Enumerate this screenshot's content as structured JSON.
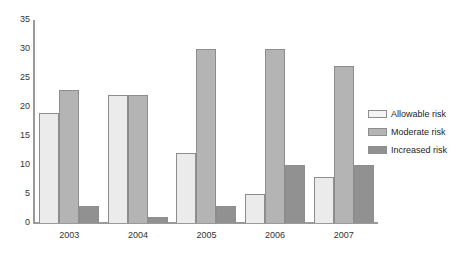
{
  "chart_data": {
    "type": "bar",
    "title": "",
    "subtitle": "",
    "xlabel": "",
    "ylabel": "",
    "categories": [
      "2003",
      "2004",
      "2005",
      "2006",
      "2007"
    ],
    "series": [
      {
        "name": "Allowable risk",
        "color": "#ebebeb",
        "values": [
          19,
          22,
          12,
          5,
          8
        ]
      },
      {
        "name": "Moderate risk",
        "color": "#b4b4b4",
        "values": [
          23,
          22,
          30,
          30,
          27
        ]
      },
      {
        "name": "Increased risk",
        "color": "#919191",
        "values": [
          3,
          1,
          3,
          10,
          10
        ]
      }
    ],
    "ylim": [
      0,
      35
    ],
    "ytick_step": 5,
    "yticks": [
      "35",
      "30",
      "25",
      "20",
      "15",
      "10",
      "5",
      "0"
    ],
    "grid": false,
    "legend_position": "right"
  },
  "legend": {
    "entries": [
      {
        "label": "Allowable risk"
      },
      {
        "label": "Moderate risk"
      },
      {
        "label": "Increased risk"
      }
    ]
  }
}
